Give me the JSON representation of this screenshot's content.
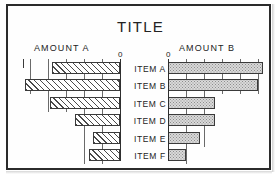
{
  "chart_data": {
    "type": "bar",
    "subtype": "butterfly-diverging-horizontal",
    "title": "TITLE",
    "categories": [
      "ITEM A",
      "ITEM B",
      "ITEM C",
      "ITEM D",
      "ITEM E",
      "ITEM F"
    ],
    "series": [
      {
        "name": "AMOUNT A",
        "direction": "left",
        "fill": "diagonal-hatch",
        "zero_label": "0",
        "values": [
          3.8,
          5.3,
          3.9,
          2.5,
          1.5,
          1.7
        ],
        "axis_range": [
          0,
          5.5
        ],
        "gridline_interval": 1,
        "gridlines": [
          1,
          2,
          3,
          4,
          5
        ],
        "ticks": [
          1,
          2,
          3,
          4,
          5
        ]
      },
      {
        "name": "AMOUNT B",
        "direction": "right",
        "fill": "stipple",
        "zero_label": "0",
        "values": [
          5.3,
          5.0,
          2.6,
          2.6,
          1.8,
          1.0
        ],
        "axis_range": [
          0,
          5.5
        ],
        "gridline_interval": 1,
        "gridlines": [
          1,
          2,
          3,
          4,
          5
        ],
        "ticks": [
          1,
          2,
          3,
          4,
          5
        ]
      }
    ],
    "xlabel": "",
    "ylabel": "",
    "grid": true,
    "legend": "none",
    "colors": {
      "frame": "#2b2b2b",
      "background": "#ffffff",
      "text": "#232323",
      "axis": "#2e2e2e",
      "gridline": "#6a6a6a",
      "bar_left_fill": "#ffffff",
      "bar_left_hatch": "#4a4a4a",
      "bar_right_fill": "#d9d9d9",
      "bar_right_stipple": "#8d8d8d",
      "bar_outline": "#3a3a3a"
    }
  }
}
